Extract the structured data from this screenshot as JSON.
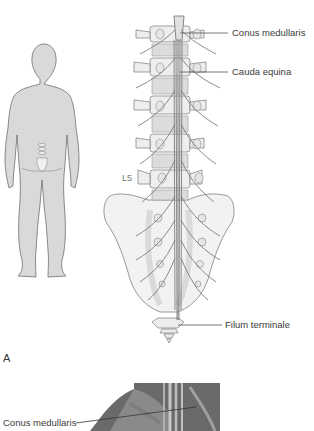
{
  "figure": {
    "panel_a_letter": "A",
    "labels": {
      "conus_medullaris": "Conus medullaris",
      "cauda_equina": "Cauda equina",
      "l5": "L5",
      "filum_terminale": "Filum terminale"
    },
    "panel_b": {
      "labels": {
        "conus_medullaris": "Conus medullaris"
      }
    },
    "colors": {
      "body_fill": "#d9d9d9",
      "body_outline": "#6e6e6e",
      "bone_fill": "#f0f0f0",
      "bone_outline": "#7a7a7a",
      "nerve_fill": "#cfcfcf",
      "leader_line": "#555555",
      "text": "#3a3a3a"
    }
  }
}
